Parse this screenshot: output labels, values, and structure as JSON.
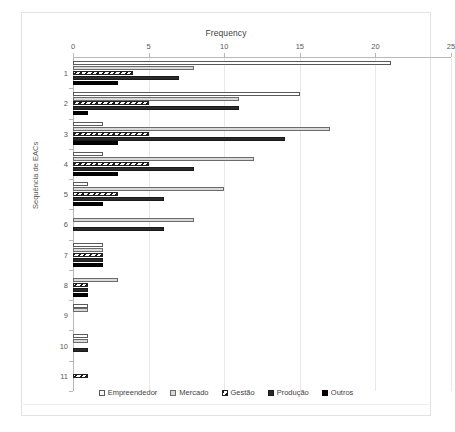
{
  "chart_data": {
    "type": "bar",
    "orientation": "horizontal",
    "title": "Frequency",
    "xlabel": "Frequency",
    "ylabel": "Sequência de EACs",
    "xlim": [
      0,
      25
    ],
    "xticks": [
      0,
      5,
      10,
      15,
      20,
      25
    ],
    "xtick_labels": [
      "0",
      "5",
      "10",
      "15",
      "20",
      "25"
    ],
    "grid": true,
    "grid_axis": "x",
    "legend_position": "bottom",
    "categories": [
      "1",
      "2",
      "3",
      "4",
      "5",
      "6",
      "7",
      "8",
      "9",
      "10",
      "11"
    ],
    "series": [
      {
        "name": "Empreendedor",
        "color": "#ffffff",
        "pattern": "solid",
        "values": [
          21,
          15,
          2,
          2,
          1,
          0,
          2,
          0,
          1,
          1,
          0
        ]
      },
      {
        "name": "Mercado",
        "color": "#d9d9d9",
        "pattern": "solid",
        "values": [
          8,
          11,
          17,
          12,
          10,
          8,
          2,
          3,
          1,
          1,
          0
        ]
      },
      {
        "name": "Gestão",
        "color": "#ffffff",
        "pattern": "diagonal-hatch",
        "values": [
          4,
          5,
          5,
          5,
          3,
          0,
          2,
          1,
          0,
          0,
          1
        ]
      },
      {
        "name": "Produção",
        "color": "#2a2a2a",
        "pattern": "solid",
        "values": [
          7,
          11,
          14,
          8,
          6,
          6,
          2,
          1,
          0,
          1,
          0
        ]
      },
      {
        "name": "Outros",
        "color": "#000000",
        "pattern": "solid",
        "values": [
          3,
          1,
          3,
          3,
          2,
          0,
          2,
          1,
          0,
          0,
          0
        ]
      }
    ]
  },
  "legend": {
    "items": [
      {
        "label": "Empreendedor"
      },
      {
        "label": "Mercado"
      },
      {
        "label": "Gestão"
      },
      {
        "label": "Produção"
      },
      {
        "label": "Outros"
      }
    ]
  }
}
